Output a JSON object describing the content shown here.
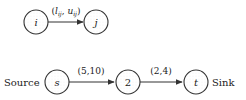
{
  "diagram": {
    "type": "network-flow",
    "colors": {
      "stroke": "#333333",
      "text": "#222222",
      "background": "#ffffff"
    },
    "legend_graph": {
      "nodes": [
        {
          "id": "i",
          "label": "i"
        },
        {
          "id": "j",
          "label": "j"
        }
      ],
      "edges": [
        {
          "from": "i",
          "to": "j",
          "label_prefix": "(",
          "lower": "l",
          "lower_sub": "ij",
          "sep": ", ",
          "upper": "u",
          "upper_sub": "ij",
          "label_suffix": ")"
        }
      ]
    },
    "example_graph": {
      "source_label": "Source",
      "sink_label": "Sink",
      "nodes": [
        {
          "id": "s",
          "label": "s"
        },
        {
          "id": "2",
          "label": "2"
        },
        {
          "id": "t",
          "label": "t"
        }
      ],
      "edges": [
        {
          "from": "s",
          "to": "2",
          "label": "(5,10)"
        },
        {
          "from": "2",
          "to": "t",
          "label": "(2,4)"
        }
      ]
    }
  }
}
